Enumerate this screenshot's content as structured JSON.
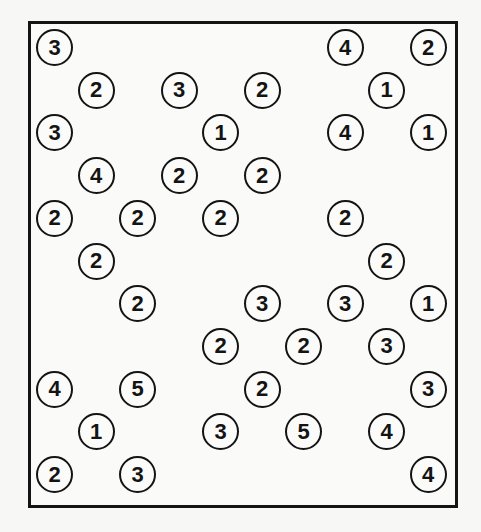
{
  "puzzle": {
    "type": "hashiwokakero",
    "columns": 10,
    "rows": 11,
    "colors": {
      "ink": "#141414",
      "paper": "#fafaf8"
    },
    "islands": [
      {
        "row": 0,
        "col": 0,
        "value": "3"
      },
      {
        "row": 0,
        "col": 7,
        "value": "4"
      },
      {
        "row": 0,
        "col": 9,
        "value": "2"
      },
      {
        "row": 1,
        "col": 1,
        "value": "2"
      },
      {
        "row": 1,
        "col": 3,
        "value": "3"
      },
      {
        "row": 1,
        "col": 5,
        "value": "2"
      },
      {
        "row": 1,
        "col": 8,
        "value": "1"
      },
      {
        "row": 2,
        "col": 0,
        "value": "3"
      },
      {
        "row": 2,
        "col": 4,
        "value": "1"
      },
      {
        "row": 2,
        "col": 7,
        "value": "4"
      },
      {
        "row": 2,
        "col": 9,
        "value": "1"
      },
      {
        "row": 3,
        "col": 1,
        "value": "4"
      },
      {
        "row": 3,
        "col": 3,
        "value": "2"
      },
      {
        "row": 3,
        "col": 5,
        "value": "2"
      },
      {
        "row": 4,
        "col": 0,
        "value": "2"
      },
      {
        "row": 4,
        "col": 2,
        "value": "2"
      },
      {
        "row": 4,
        "col": 4,
        "value": "2"
      },
      {
        "row": 4,
        "col": 7,
        "value": "2"
      },
      {
        "row": 5,
        "col": 1,
        "value": "2"
      },
      {
        "row": 5,
        "col": 8,
        "value": "2"
      },
      {
        "row": 6,
        "col": 2,
        "value": "2"
      },
      {
        "row": 6,
        "col": 5,
        "value": "3"
      },
      {
        "row": 6,
        "col": 7,
        "value": "3"
      },
      {
        "row": 6,
        "col": 9,
        "value": "1"
      },
      {
        "row": 7,
        "col": 4,
        "value": "2"
      },
      {
        "row": 7,
        "col": 6,
        "value": "2"
      },
      {
        "row": 7,
        "col": 8,
        "value": "3"
      },
      {
        "row": 8,
        "col": 0,
        "value": "4"
      },
      {
        "row": 8,
        "col": 2,
        "value": "5"
      },
      {
        "row": 8,
        "col": 5,
        "value": "2"
      },
      {
        "row": 8,
        "col": 9,
        "value": "3"
      },
      {
        "row": 9,
        "col": 1,
        "value": "1"
      },
      {
        "row": 9,
        "col": 4,
        "value": "3"
      },
      {
        "row": 9,
        "col": 6,
        "value": "5"
      },
      {
        "row": 9,
        "col": 8,
        "value": "4"
      },
      {
        "row": 10,
        "col": 0,
        "value": "2"
      },
      {
        "row": 10,
        "col": 2,
        "value": "3"
      },
      {
        "row": 10,
        "col": 9,
        "value": "4"
      }
    ]
  }
}
